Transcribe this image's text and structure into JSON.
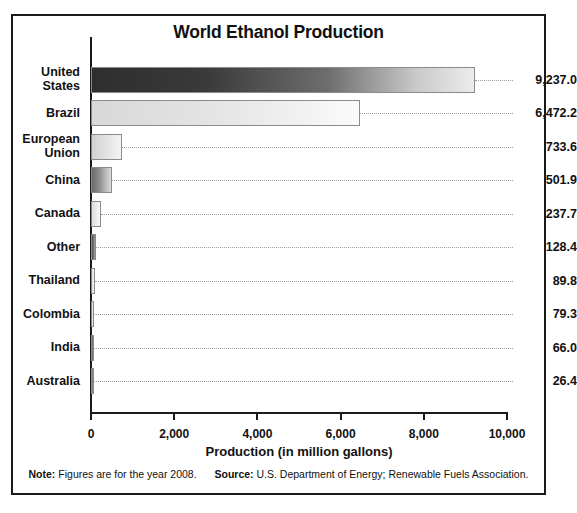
{
  "chart_data": {
    "type": "bar",
    "orientation": "horizontal",
    "title": "World Ethanol Production",
    "xlabel": "Production (in million gallons)",
    "ylabel": "",
    "xlim": [
      0,
      10000
    ],
    "xticks": [
      0,
      2000,
      4000,
      6000,
      8000,
      10000
    ],
    "xtick_labels": [
      "0",
      "2,000",
      "4,000",
      "6,000",
      "8,000",
      "10,000"
    ],
    "grid": false,
    "leader_lines": true,
    "legend": null,
    "categories": [
      "United States",
      "Brazil",
      "European Union",
      "China",
      "Canada",
      "Other",
      "Thailand",
      "Colombia",
      "India",
      "Australia"
    ],
    "values": [
      9237.0,
      6472.2,
      733.6,
      501.9,
      237.7,
      128.4,
      89.8,
      79.3,
      66.0,
      26.4
    ],
    "value_labels": [
      "9,237.0",
      "6,472.2",
      "733.6",
      "501.9",
      "237.7",
      "128.4",
      "89.8",
      "79.3",
      "66.0",
      "26.4"
    ],
    "bar_fills": [
      "linear-gradient(90deg, #2e2e2e 0%, #3a3a3a 30%, #6e6e6e 62%, #c9c9c9 85%, #ececec 100%)",
      "linear-gradient(90deg, #d8d8d8 0%, #e4e4e4 45%, #f2f2f2 80%, #fbfbfb 100%)",
      "linear-gradient(90deg, #d0d0d0 0%, #e2e2e2 50%, #f4f4f4 100%)",
      "linear-gradient(90deg, #6b6b6b 0%, #8f8f8f 40%, #bdbdbd 75%, #dcdcdc 100%)",
      "linear-gradient(90deg, #dcdcdc 0%, #ededed 60%, #f8f8f8 100%)",
      "linear-gradient(90deg, #555555 0%, #7a7a7a 60%, #a0a0a0 100%)",
      "linear-gradient(90deg, #e0e0e0 0%, #f0f0f0 100%)",
      "linear-gradient(90deg, #dedede 0%, #efefef 100%)",
      "linear-gradient(90deg, #5a5a5a 0%, #8a8a8a 100%)",
      "linear-gradient(90deg, #707070 0%, #9a9a9a 100%)"
    ],
    "notes": {
      "note_label": "Note:",
      "note_text": "Figures are for the year 2008.",
      "source_label": "Source:",
      "source_text": "U.S. Department of Energy; Renewable Fuels Association."
    },
    "colors": {
      "frame": "#1a1a1a",
      "axis": "#1a1a1a",
      "text": "#111111",
      "bar_outline": "#8b8b8b",
      "leader": "#9b9b9b",
      "background": "#ffffff"
    }
  }
}
